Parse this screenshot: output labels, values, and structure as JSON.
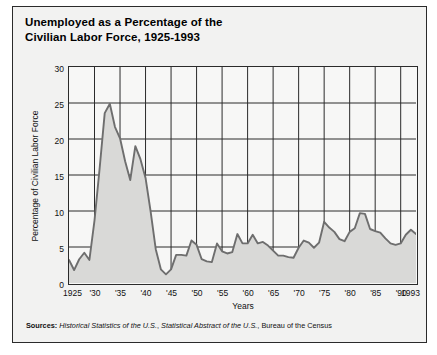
{
  "title": {
    "line1": "Unemployed as a Percentage of the",
    "line2": "Civilian Labor Force, 1925-1993"
  },
  "sources": {
    "label": "Sources:",
    "italic_1": "Historical Statistics of the U.S.",
    "sep_1": ", ",
    "italic_2": "Statistical Abstract of the U.S.",
    "sep_2": ", ",
    "plain_tail": "Bureau of the Census"
  },
  "colors": {
    "line": "#6e6e6e",
    "fill": "#d9d9d7",
    "frame": "#2b2b2b",
    "page_background": "#ffffff",
    "panel_background": "#f2f2f1",
    "plot_background": "#f7f7f6",
    "text": "#111111"
  },
  "chart_data": {
    "type": "area",
    "title": "Unemployed as a Percentage of the Civilian Labor Force, 1925-1993",
    "xlabel": "Years",
    "ylabel": "Percentage of Civilian Labor Force",
    "xlim": [
      1925,
      1993
    ],
    "ylim": [
      0,
      30
    ],
    "ytick_values": [
      0,
      5,
      10,
      15,
      20,
      25,
      30
    ],
    "ytick_labels": [
      "0",
      "5",
      "10",
      "15",
      "20",
      "25",
      "30"
    ],
    "xtick_values": [
      1925,
      1930,
      1935,
      1940,
      1945,
      1950,
      1955,
      1960,
      1965,
      1970,
      1975,
      1980,
      1985,
      1990,
      1993
    ],
    "xtick_labels": [
      "1925",
      "'30",
      "'35",
      "'40",
      "'45",
      "'50",
      "'55",
      "'60",
      "'65",
      "'70",
      "'75",
      "'80",
      "'85",
      "'90",
      "1993"
    ],
    "grid": true,
    "grid_axes": "both",
    "legend": false,
    "series_name": "Unemployment rate",
    "x": [
      1925,
      1926,
      1927,
      1928,
      1929,
      1930,
      1931,
      1932,
      1933,
      1934,
      1935,
      1936,
      1937,
      1938,
      1939,
      1940,
      1941,
      1942,
      1943,
      1944,
      1945,
      1946,
      1947,
      1948,
      1949,
      1950,
      1951,
      1952,
      1953,
      1954,
      1955,
      1956,
      1957,
      1958,
      1959,
      1960,
      1961,
      1962,
      1963,
      1964,
      1965,
      1966,
      1967,
      1968,
      1969,
      1970,
      1971,
      1972,
      1973,
      1974,
      1975,
      1976,
      1977,
      1978,
      1979,
      1980,
      1981,
      1982,
      1983,
      1984,
      1985,
      1986,
      1987,
      1988,
      1989,
      1990,
      1991,
      1992,
      1993
    ],
    "values": [
      3.2,
      1.8,
      3.3,
      4.2,
      3.2,
      8.7,
      15.9,
      23.6,
      24.9,
      21.7,
      20.1,
      16.9,
      14.3,
      19.0,
      17.2,
      14.6,
      9.9,
      4.7,
      1.9,
      1.2,
      1.9,
      3.9,
      3.9,
      3.8,
      5.9,
      5.3,
      3.3,
      3.0,
      2.9,
      5.5,
      4.4,
      4.1,
      4.3,
      6.8,
      5.5,
      5.5,
      6.7,
      5.5,
      5.7,
      5.2,
      4.5,
      3.8,
      3.8,
      3.6,
      3.5,
      4.9,
      5.9,
      5.6,
      4.9,
      5.6,
      8.5,
      7.7,
      7.1,
      6.1,
      5.8,
      7.1,
      7.6,
      9.7,
      9.6,
      7.5,
      7.2,
      7.0,
      6.2,
      5.5,
      5.3,
      5.5,
      6.7,
      7.4,
      6.8
    ]
  }
}
